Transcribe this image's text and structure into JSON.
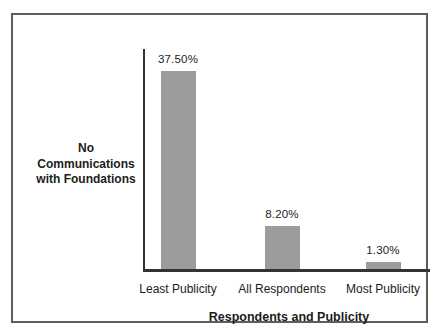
{
  "figure": {
    "background": "#ffffff",
    "frame_border_color": "#5e5e5e",
    "text_color": "#1c1c1c"
  },
  "chart_data": {
    "type": "bar",
    "title": "",
    "xlabel": "Respondents and Publicity",
    "ylabel": "No\nCommunications\nwith Foundations",
    "categories": [
      "Least Publicity",
      "All Respondents",
      "Most Publicity"
    ],
    "values": [
      37.5,
      8.2,
      1.3
    ],
    "value_labels": [
      "37.50%",
      "8.20%",
      "1.30%"
    ],
    "ylim": [
      0,
      40
    ],
    "bar_color": "#9c9c9c",
    "axis_color": "#333333",
    "grid": false,
    "legend_position": "none"
  }
}
